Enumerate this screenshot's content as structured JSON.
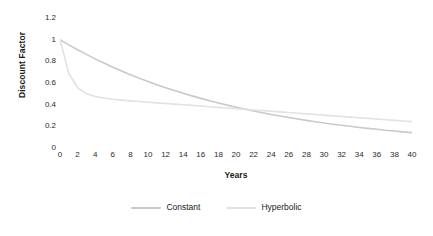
{
  "chart_data": {
    "type": "line",
    "title": "",
    "xlabel": "Years",
    "ylabel": "Discount Factor",
    "xlim": [
      0,
      40
    ],
    "ylim": [
      0,
      1.2
    ],
    "grid": false,
    "legend_position": "bottom",
    "x_ticks": [
      "0",
      "2",
      "4",
      "6",
      "8",
      "10",
      "12",
      "14",
      "16",
      "18",
      "20",
      "22",
      "24",
      "26",
      "28",
      "30",
      "32",
      "34",
      "36",
      "38",
      "40"
    ],
    "y_ticks": [
      "0",
      "0.2",
      "0.4",
      "0.6",
      "0.8",
      "1",
      "1.2"
    ],
    "x": [
      0,
      1,
      2,
      3,
      4,
      5,
      6,
      7,
      8,
      9,
      10,
      11,
      12,
      13,
      14,
      15,
      16,
      17,
      18,
      19,
      20,
      21,
      22,
      23,
      24,
      25,
      26,
      27,
      28,
      29,
      30,
      31,
      32,
      33,
      34,
      35,
      36,
      37,
      38,
      39,
      40
    ],
    "series": [
      {
        "name": "Constant",
        "color": "#c9c9c9",
        "values": [
          1.0,
          0.952,
          0.907,
          0.864,
          0.823,
          0.784,
          0.746,
          0.711,
          0.677,
          0.645,
          0.614,
          0.585,
          0.557,
          0.53,
          0.505,
          0.481,
          0.458,
          0.436,
          0.416,
          0.396,
          0.377,
          0.359,
          0.342,
          0.326,
          0.31,
          0.295,
          0.281,
          0.268,
          0.255,
          0.243,
          0.231,
          0.22,
          0.21,
          0.2,
          0.19,
          0.181,
          0.173,
          0.164,
          0.157,
          0.149,
          0.142
        ]
      },
      {
        "name": "Hyperbolic",
        "color": "#e2e2e2",
        "values": [
          1.0,
          0.69,
          0.556,
          0.5,
          0.476,
          0.461,
          0.45,
          0.442,
          0.435,
          0.429,
          0.423,
          0.417,
          0.411,
          0.405,
          0.399,
          0.393,
          0.387,
          0.381,
          0.375,
          0.369,
          0.363,
          0.357,
          0.351,
          0.345,
          0.339,
          0.333,
          0.327,
          0.321,
          0.315,
          0.309,
          0.303,
          0.297,
          0.291,
          0.285,
          0.279,
          0.273,
          0.267,
          0.261,
          0.255,
          0.249,
          0.243
        ]
      }
    ]
  },
  "legend": {
    "items": [
      {
        "label": "Constant"
      },
      {
        "label": "Hyperbolic"
      }
    ]
  }
}
